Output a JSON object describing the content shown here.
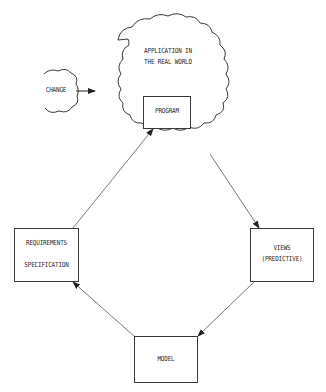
{
  "diagram": {
    "type": "flow-cycle",
    "colors": {
      "stroke": "#3a3a3a",
      "text": "#2a2a2a",
      "background": "#ffffff"
    },
    "nodes": {
      "application": {
        "shape": "cloud",
        "line1": "APPLICATION IN",
        "line2": "THE REAL WORLD"
      },
      "change": {
        "shape": "cloud",
        "label": "CHANGE"
      },
      "program": {
        "shape": "box",
        "label": "PROGRAM"
      },
      "requirements": {
        "shape": "box",
        "line1": "REQUIREMENTS",
        "line2": "SPECIFICATION",
        "inner_arrow": "down"
      },
      "views": {
        "shape": "box",
        "line1": "VIEWS",
        "line2": "(PREDICTIVE)"
      },
      "model": {
        "shape": "box",
        "label": "MODEL"
      }
    },
    "edges": [
      {
        "from": "change",
        "to": "application",
        "arrow": true
      },
      {
        "from": "requirements",
        "to": "program",
        "arrow": true
      },
      {
        "from": "application",
        "to": "views",
        "arrow": true
      },
      {
        "from": "views",
        "to": "model",
        "arrow": true
      },
      {
        "from": "model",
        "to": "requirements",
        "arrow": true
      },
      {
        "from": "requirements.line1",
        "to": "requirements.line2",
        "arrow": true
      }
    ]
  }
}
